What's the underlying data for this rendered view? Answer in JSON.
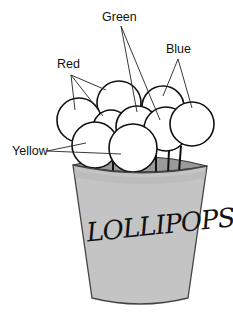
{
  "diagram": {
    "cup_label": "LOLLIPOPS",
    "labels": [
      {
        "id": "green",
        "text": "Green",
        "x": 102,
        "y": 21,
        "origin": [
          121,
          26
        ],
        "targets": [
          [
            137,
            112
          ],
          [
            160,
            120
          ]
        ]
      },
      {
        "id": "blue",
        "text": "Blue",
        "x": 166,
        "y": 53,
        "origin": [
          178,
          59
        ],
        "targets": [
          [
            163,
            96
          ],
          [
            192,
            108
          ]
        ]
      },
      {
        "id": "red",
        "text": "Red",
        "x": 57,
        "y": 68,
        "origin": [
          71,
          75
        ],
        "targets": [
          [
            75,
            110
          ],
          [
            106,
            90
          ],
          [
            103,
            116
          ]
        ]
      },
      {
        "id": "yellow",
        "text": "Yellow",
        "x": 12,
        "y": 155,
        "origin": [
          47,
          151
        ],
        "targets": [
          [
            86,
            143
          ],
          [
            121,
            154
          ]
        ]
      }
    ],
    "lollipops": [
      {
        "color": "Red",
        "cx": 119,
        "cy": 103,
        "r": 22
      },
      {
        "color": "Blue",
        "cx": 163,
        "cy": 107,
        "r": 21
      },
      {
        "color": "Red",
        "cx": 79,
        "cy": 120,
        "r": 22
      },
      {
        "color": "Red",
        "cx": 111,
        "cy": 128,
        "r": 18
      },
      {
        "color": "Green",
        "cx": 137,
        "cy": 127,
        "r": 21
      },
      {
        "color": "Green",
        "cx": 166,
        "cy": 129,
        "r": 22
      },
      {
        "color": "Blue",
        "cx": 192,
        "cy": 124,
        "r": 22
      },
      {
        "color": "Yellow",
        "cx": 95,
        "cy": 145,
        "r": 23
      },
      {
        "color": "Yellow",
        "cx": 133,
        "cy": 148,
        "r": 24
      }
    ],
    "sticks": [
      [
        91,
        163,
        91,
        170
      ],
      [
        96,
        163,
        96,
        170
      ],
      [
        113,
        150,
        113,
        172
      ],
      [
        125,
        167,
        125,
        175
      ],
      [
        131,
        168,
        131,
        176
      ],
      [
        137,
        167,
        137,
        175
      ],
      [
        156,
        152,
        156,
        175
      ],
      [
        169,
        150,
        168,
        174
      ],
      [
        181,
        146,
        179,
        172
      ]
    ],
    "colors": {
      "cup_fill": "#c4c4c4",
      "cup_inner": "#9a9a9a",
      "outline": "#111111",
      "background": "#ffffff"
    }
  }
}
